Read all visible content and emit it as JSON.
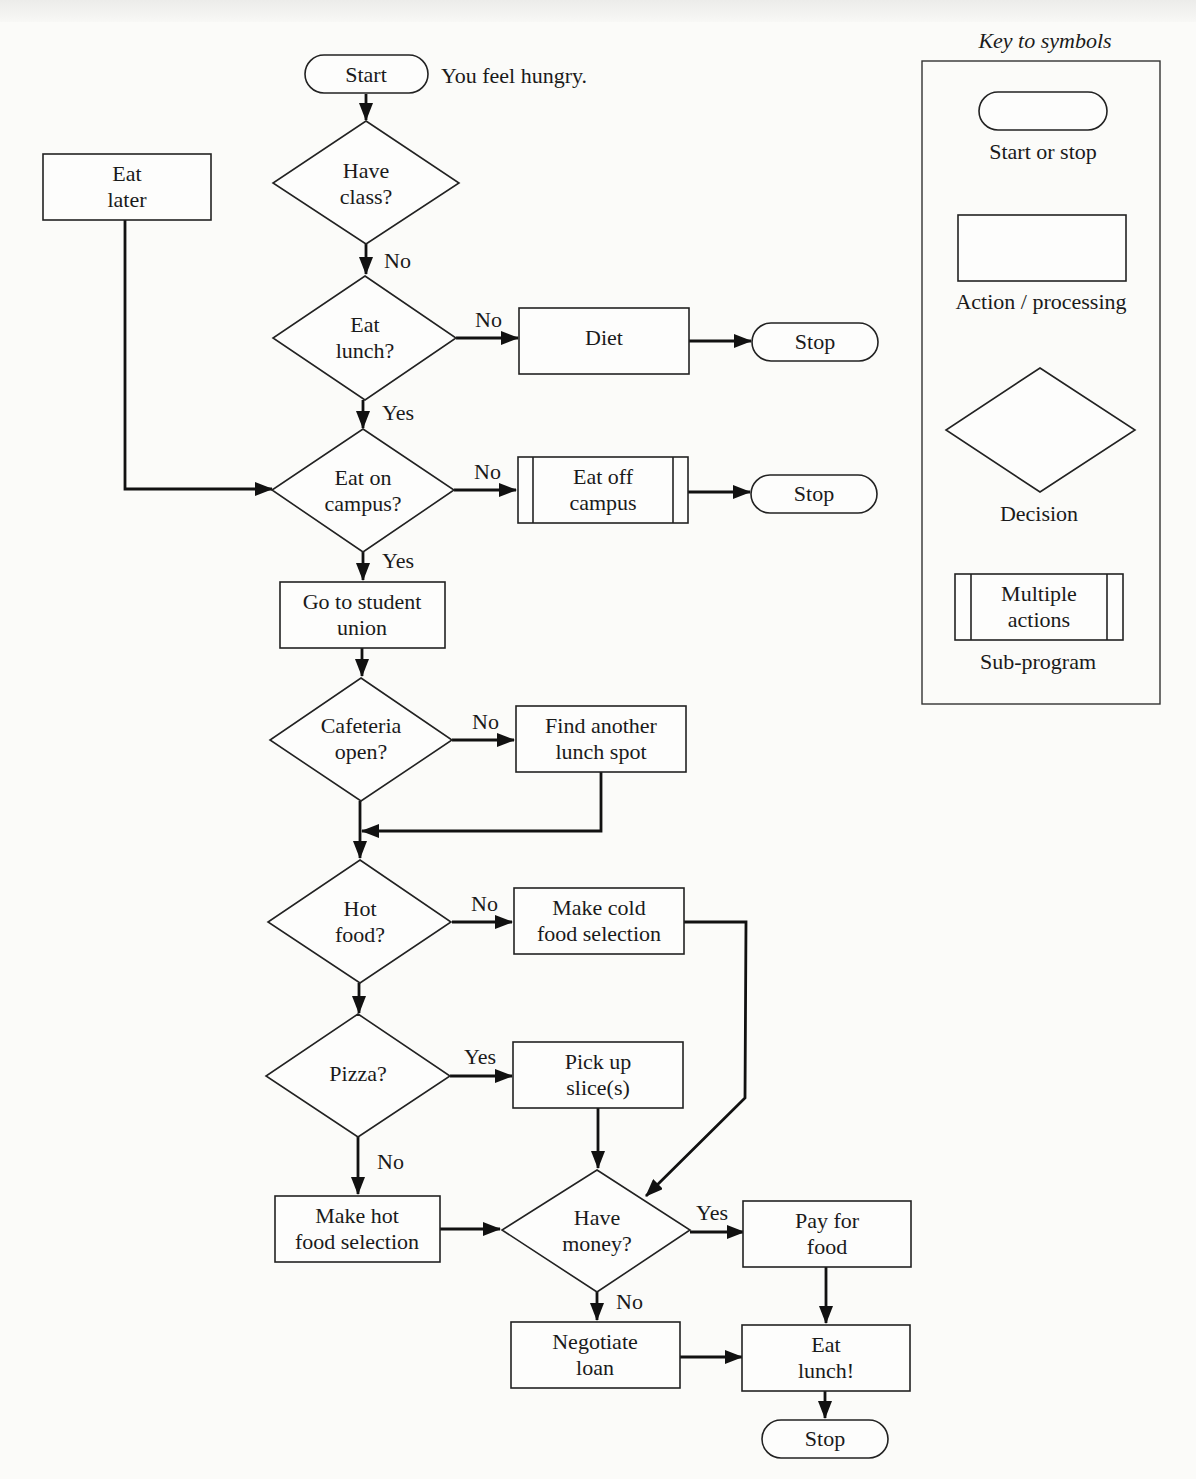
{
  "flowchart": {
    "start_note": "You feel hungry.",
    "nodes": {
      "start": {
        "type": "terminal",
        "lines": [
          "Start"
        ]
      },
      "have_class": {
        "type": "decision",
        "lines": [
          "Have",
          "class?"
        ]
      },
      "eat_later": {
        "type": "process",
        "lines": [
          "Eat",
          "later"
        ]
      },
      "eat_lunch": {
        "type": "decision",
        "lines": [
          "Eat",
          "lunch?"
        ]
      },
      "diet": {
        "type": "process",
        "lines": [
          "Diet"
        ]
      },
      "stop_diet": {
        "type": "terminal",
        "lines": [
          "Stop"
        ]
      },
      "eat_on_campus": {
        "type": "decision",
        "lines": [
          "Eat on",
          "campus?"
        ]
      },
      "eat_off_campus": {
        "type": "subprogram",
        "lines": [
          "Eat off",
          "campus"
        ]
      },
      "stop_off_campus": {
        "type": "terminal",
        "lines": [
          "Stop"
        ]
      },
      "go_union": {
        "type": "process",
        "lines": [
          "Go to student",
          "union"
        ]
      },
      "cafeteria_open": {
        "type": "decision",
        "lines": [
          "Cafeteria",
          "open?"
        ]
      },
      "find_spot": {
        "type": "process",
        "lines": [
          "Find another",
          "lunch spot"
        ]
      },
      "hot_food": {
        "type": "decision",
        "lines": [
          "Hot",
          "food?"
        ]
      },
      "cold_selection": {
        "type": "process",
        "lines": [
          "Make cold",
          "food selection"
        ]
      },
      "pizza": {
        "type": "decision",
        "lines": [
          "Pizza?"
        ]
      },
      "pick_slice": {
        "type": "process",
        "lines": [
          "Pick up",
          "slice(s)"
        ]
      },
      "hot_selection": {
        "type": "process",
        "lines": [
          "Make hot",
          "food selection"
        ]
      },
      "have_money": {
        "type": "decision",
        "lines": [
          "Have",
          "money?"
        ]
      },
      "pay_food": {
        "type": "process",
        "lines": [
          "Pay for",
          "food"
        ]
      },
      "negotiate_loan": {
        "type": "process",
        "lines": [
          "Negotiate",
          "loan"
        ]
      },
      "eat_lunch_final": {
        "type": "process",
        "lines": [
          "Eat",
          "lunch!"
        ]
      },
      "stop_final": {
        "type": "terminal",
        "lines": [
          "Stop"
        ]
      }
    },
    "edge_labels": {
      "have_class_no": "No",
      "eat_lunch_no": "No",
      "eat_lunch_yes": "Yes",
      "eat_on_campus_no": "No",
      "eat_on_campus_yes": "Yes",
      "cafeteria_no": "No",
      "hot_food_no": "No",
      "pizza_yes": "Yes",
      "pizza_no": "No",
      "have_money_yes": "Yes",
      "have_money_no": "No"
    }
  },
  "key": {
    "title": "Key to symbols",
    "items": [
      {
        "symbol": "terminal",
        "label": "Start or stop"
      },
      {
        "symbol": "process",
        "label": "Action / processing"
      },
      {
        "symbol": "decision",
        "label": "Decision"
      },
      {
        "symbol": "subprogram",
        "label": "Sub-program",
        "inner_lines": [
          "Multiple",
          "actions"
        ]
      }
    ]
  }
}
